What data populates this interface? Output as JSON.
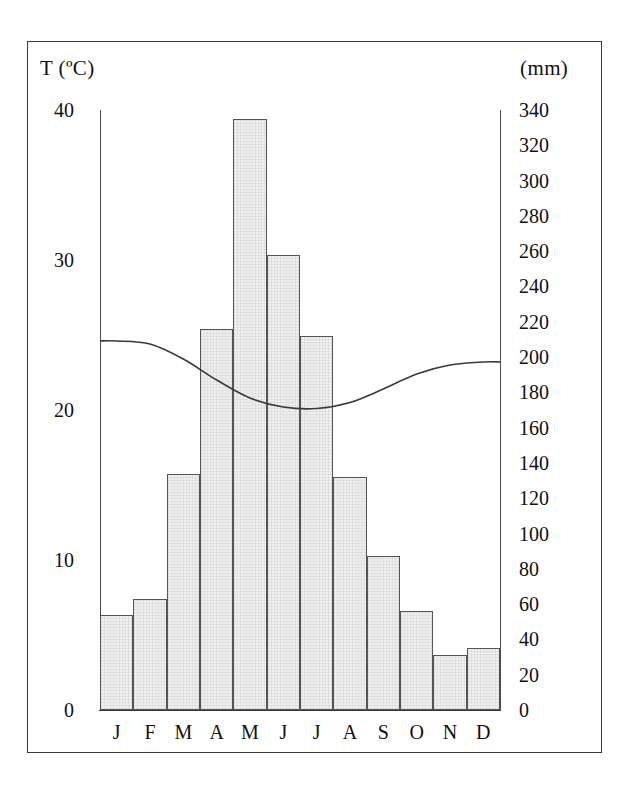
{
  "axes": {
    "left_title": "T (ºC)",
    "right_title": "(mm)",
    "left_ticks": [
      "40",
      "30",
      "20",
      "10",
      "0"
    ],
    "right_ticks": [
      "340",
      "320",
      "300",
      "280",
      "260",
      "240",
      "220",
      "200",
      "180",
      "160",
      "140",
      "120",
      "100",
      "80",
      "60",
      "40",
      "20",
      "0"
    ]
  },
  "months": [
    "J",
    "F",
    "M",
    "A",
    "M",
    "J",
    "J",
    "A",
    "S",
    "O",
    "N",
    "D"
  ],
  "chart_data": {
    "type": "bar",
    "title": "",
    "subtitle": "",
    "categories": [
      "J",
      "F",
      "M",
      "A",
      "M",
      "J",
      "J",
      "A",
      "S",
      "O",
      "N",
      "D"
    ],
    "xlabel": "",
    "ylabel": "(mm)",
    "ylim": [
      0,
      340
    ],
    "grid": false,
    "legend": "none",
    "series": [
      {
        "name": "Precipitation",
        "unit": "mm",
        "type": "bar",
        "axis": "right",
        "values": [
          54,
          63,
          134,
          216,
          335,
          258,
          212,
          132,
          87,
          56,
          31,
          35
        ]
      },
      {
        "name": "Temperature",
        "unit": "ºC",
        "type": "line",
        "axis": "left",
        "ylim": [
          0,
          40
        ],
        "values": [
          24.6,
          24.4,
          23.4,
          22.0,
          20.8,
          20.2,
          20.1,
          20.5,
          21.4,
          22.4,
          23.0,
          23.2
        ]
      }
    ],
    "annotations": []
  },
  "style": {
    "bar_fill": "#efefef",
    "bar_stroke": "#555555",
    "line_color": "#3a3a3a",
    "frame_color": "#3a3a3a",
    "text_color": "#111111"
  }
}
